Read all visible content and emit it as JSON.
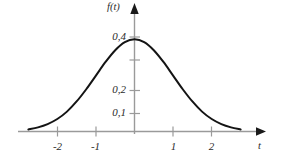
{
  "figure": {
    "background_color": "#ffffff",
    "axis_color": "#9a9a9a",
    "curve_color": "#141414",
    "text_color": "#2b2b2b"
  },
  "axes": {
    "y_axis_name": "f(t)",
    "x_axis_name": "t",
    "y_axis_name_icon": "y-axis-arrow-icon",
    "x_axis_name_icon": "x-axis-arrow-icon"
  },
  "chart_data": {
    "type": "line",
    "title": "",
    "subtitle": "",
    "xlabel": "t",
    "ylabel": "f(t)",
    "xlim": [
      -2.95,
      3.3
    ],
    "ylim": [
      -0.02,
      0.47
    ],
    "grid": false,
    "legend": null,
    "decimal_separator": ",",
    "x_ticks": [
      -2,
      -1,
      1,
      2
    ],
    "x_tick_labels": [
      "-2",
      "-1",
      "1",
      "2"
    ],
    "y_ticks": [
      0.1,
      0.2,
      0.3,
      0.4
    ],
    "y_tick_labels": [
      "0,1",
      "0,2",
      "",
      "0,4"
    ],
    "y_ticks_labeled": [
      0.1,
      0.2,
      0.4
    ],
    "peak": {
      "x": 0,
      "y": 0.4
    },
    "series": [
      {
        "name": "f(t)",
        "x": [
          -2.75,
          -2.5,
          -2.25,
          -2.0,
          -1.75,
          -1.5,
          -1.25,
          -1.0,
          -0.75,
          -0.5,
          -0.25,
          0.0,
          0.25,
          0.5,
          0.75,
          1.0,
          1.25,
          1.5,
          1.75,
          2.0,
          2.25,
          2.5,
          2.75
        ],
        "values": [
          0.009,
          0.018,
          0.032,
          0.054,
          0.086,
          0.13,
          0.183,
          0.242,
          0.301,
          0.352,
          0.387,
          0.399,
          0.387,
          0.352,
          0.301,
          0.242,
          0.183,
          0.13,
          0.086,
          0.054,
          0.032,
          0.018,
          0.009
        ]
      }
    ]
  },
  "tick_labels": {
    "y": [
      {
        "text": "0,4",
        "value": 0.4
      },
      {
        "text": "0,2",
        "value": 0.2
      },
      {
        "text": "0,1",
        "value": 0.1
      }
    ],
    "x": [
      {
        "text": "-2",
        "value": -2
      },
      {
        "text": "-1",
        "value": -1
      },
      {
        "text": "1",
        "value": 1
      },
      {
        "text": "2",
        "value": 2
      }
    ]
  }
}
